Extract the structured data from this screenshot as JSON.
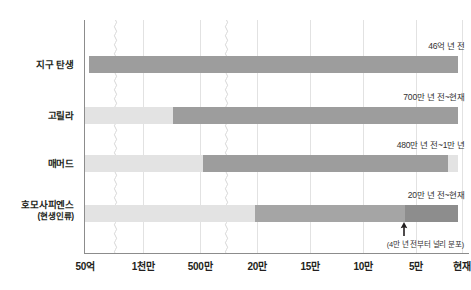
{
  "chart_data": {
    "type": "bar",
    "title": "",
    "xlabel": "",
    "ylabel": "",
    "orientation": "horizontal",
    "grid": true,
    "legend": "none",
    "axis_note": "Non-linear time axis with two wavy axis breaks; time runs from 50억 (4.6 billion years ago) on the left to 현재 (present) on the right.",
    "x_ticks": [
      {
        "label": "50억",
        "x": 85
      },
      {
        "label": "1천만",
        "x": 143
      },
      {
        "label": "500만",
        "x": 200
      },
      {
        "label": "20만",
        "x": 257
      },
      {
        "label": "15만",
        "x": 310
      },
      {
        "label": "10만",
        "x": 363
      },
      {
        "label": "5만",
        "x": 416
      },
      {
        "label": "현재",
        "x": 462
      }
    ],
    "axis_breaks": [
      {
        "x": 115
      },
      {
        "x": 226
      }
    ],
    "categories": [
      {
        "name": "지구 탄생",
        "sub": "",
        "value_label": "46억 년 전",
        "bar_top": 56,
        "segments": [
          {
            "start": 89,
            "end": 458,
            "color": "#9d9d9d",
            "tone": "dark"
          }
        ]
      },
      {
        "name": "고릴라",
        "sub": "",
        "value_label": "700만 년 전~현재",
        "bar_top": 107,
        "segments": [
          {
            "start": 85,
            "end": 173,
            "color": "#e3e3e3",
            "tone": "light"
          },
          {
            "start": 173,
            "end": 458,
            "color": "#9d9d9d",
            "tone": "dark"
          }
        ]
      },
      {
        "name": "매머드",
        "sub": "",
        "value_label": "480만 년 전~1만 년",
        "bar_top": 155,
        "segments": [
          {
            "start": 85,
            "end": 203,
            "color": "#e3e3e3",
            "tone": "light"
          },
          {
            "start": 203,
            "end": 448,
            "color": "#9d9d9d",
            "tone": "dark"
          },
          {
            "start": 448,
            "end": 458,
            "color": "#e3e3e3",
            "tone": "light"
          }
        ]
      },
      {
        "name": "호모사피엔스",
        "sub": "(현생인류)",
        "value_label": "20만 년 전~현재",
        "bar_top": 205,
        "segments": [
          {
            "start": 85,
            "end": 255,
            "color": "#e3e3e3",
            "tone": "light"
          },
          {
            "start": 255,
            "end": 405,
            "color": "#a5a5a5",
            "tone": "medium"
          },
          {
            "start": 405,
            "end": 458,
            "color": "#8d8d8d",
            "tone": "dark"
          }
        ]
      }
    ],
    "annotations": [
      {
        "type": "arrow-up",
        "text": "(4만 년 전부터 널리 분포)",
        "x": 403
      }
    ]
  },
  "colors": {
    "bar_dark": "#9d9d9d",
    "bar_medium": "#a5a5a5",
    "bar_light": "#e3e3e3",
    "axis": "#8c8c8c",
    "grid": "#e2e2e2",
    "text": "#231f20",
    "background": "#ffffff"
  }
}
